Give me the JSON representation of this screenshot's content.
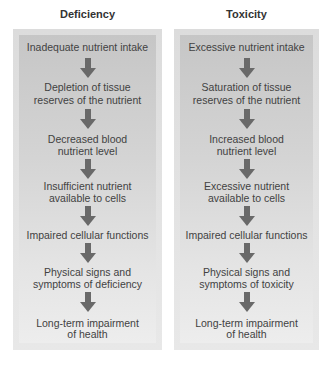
{
  "columns": [
    {
      "title": "Deficiency",
      "steps": [
        [
          "Inadequate nutrient intake"
        ],
        [
          "Depletion of tissue",
          "reserves of the nutrient"
        ],
        [
          "Decreased blood",
          "nutrient level"
        ],
        [
          "Insufficient nutrient",
          "available to cells"
        ],
        [
          "Impaired cellular functions"
        ],
        [
          "Physical signs and",
          "symptoms of deficiency"
        ],
        [
          "Long-term impairment",
          "of health"
        ]
      ]
    },
    {
      "title": "Toxicity",
      "steps": [
        [
          "Excessive nutrient intake"
        ],
        [
          "Saturation of tissue",
          "reserves of the nutrient"
        ],
        [
          "Increased blood",
          "nutrient level"
        ],
        [
          "Excessive nutrient",
          "available to cells"
        ],
        [
          "Impaired cellular functions"
        ],
        [
          "Physical signs and",
          "symptoms of toxicity"
        ],
        [
          "Long-term impairment",
          "of health"
        ]
      ]
    }
  ],
  "colors": {
    "arrow": "#696969",
    "panel_top": "#c6c6c6",
    "panel_bottom": "#ededed",
    "text": "#424242"
  }
}
